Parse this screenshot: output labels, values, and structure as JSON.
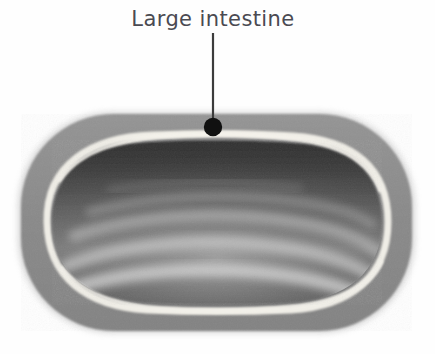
{
  "figure": {
    "kind": "anatomical-cross-section",
    "subject": "Large intestine",
    "width": 435,
    "height": 354,
    "background_color": "#fefefe",
    "style": "grayscale airbrush illustration with handwritten annotation"
  },
  "annotation": {
    "label": "Large intestine",
    "label_position": {
      "x": 213,
      "y": 26
    },
    "leader_line": {
      "name": "leader-line",
      "x": 213,
      "y_start": 33,
      "y_end": 127,
      "color": "#3a3a3a",
      "width": 2
    },
    "marker_dot": {
      "name": "leader-dot",
      "cx": 213,
      "cy": 127,
      "r": 9,
      "color": "#111111"
    }
  },
  "layers": [
    {
      "id": "outer-wall",
      "name": "muscularis-serosa-layer",
      "label": "Outer muscular wall",
      "color": "#8b8b8b",
      "halo_color": "#d5d5d5",
      "bounds": {
        "x": 18,
        "y": 112,
        "width": 397,
        "height": 221
      },
      "corner_radius": 95
    },
    {
      "id": "submucosa-band",
      "name": "submucosa-band",
      "label": "Light submucosal band",
      "color": "#eceae2",
      "thickness": 6,
      "inset": 22
    },
    {
      "id": "mucosa-lumen",
      "name": "mucosa-lumen",
      "label": "Inner mucosa and lumen",
      "color_dark": "#3f3f3f",
      "color_mid": "#6e6e6e",
      "color_light": "#9b9b9b",
      "inset": 30
    }
  ],
  "folds": {
    "name": "haustral-folds",
    "label": "Mucosal folds",
    "count": 4,
    "color": "#c6c6c6",
    "paths": [
      {
        "id": "fold-1",
        "opacity": 0.42,
        "width": 9
      },
      {
        "id": "fold-2",
        "opacity": 0.55,
        "width": 11
      },
      {
        "id": "fold-3",
        "opacity": 0.68,
        "width": 12
      },
      {
        "id": "fold-4",
        "opacity": 0.78,
        "width": 13
      }
    ]
  },
  "palette": {
    "background": "#fefefe",
    "outer_wall": "#8b8b8b",
    "submucosa": "#eceae2",
    "lumen_dark": "#3f3f3f",
    "lumen_light": "#a2a2a2",
    "fold_highlight": "#c6c6c6",
    "ink": "#4a4a52",
    "dot": "#111111"
  }
}
